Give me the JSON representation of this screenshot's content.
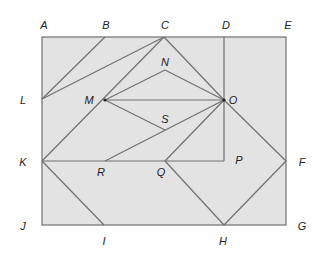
{
  "figure": {
    "type": "geometric-dissection",
    "colors": {
      "fill": "#e3e3e3",
      "stroke": "#707070",
      "label": "#222222"
    },
    "points": {
      "A": [
        42,
        37
      ],
      "B": [
        105,
        37
      ],
      "C": [
        164,
        37
      ],
      "D": [
        224,
        37
      ],
      "E": [
        286,
        37
      ],
      "L": [
        42,
        99
      ],
      "M": [
        105,
        100
      ],
      "N": [
        165,
        70
      ],
      "O": [
        224,
        100
      ],
      "S": [
        165,
        130
      ],
      "K": [
        42,
        161
      ],
      "R": [
        105,
        161
      ],
      "Q": [
        165,
        161
      ],
      "P": [
        224,
        161
      ],
      "F": [
        286,
        161
      ],
      "J": [
        42,
        225
      ],
      "I": [
        104,
        225
      ],
      "H": [
        224,
        225
      ],
      "G": [
        286,
        225
      ]
    },
    "labels": [
      {
        "text": "A",
        "x": 44,
        "y": 29
      },
      {
        "text": "B",
        "x": 106,
        "y": 29
      },
      {
        "text": "C",
        "x": 165,
        "y": 29
      },
      {
        "text": "D",
        "x": 226,
        "y": 29
      },
      {
        "text": "E",
        "x": 288,
        "y": 29
      },
      {
        "text": "L",
        "x": 23,
        "y": 104
      },
      {
        "text": "M",
        "x": 89,
        "y": 104
      },
      {
        "text": "N",
        "x": 165,
        "y": 66
      },
      {
        "text": "O",
        "x": 233,
        "y": 104
      },
      {
        "text": "S",
        "x": 165,
        "y": 123
      },
      {
        "text": "K",
        "x": 23,
        "y": 166
      },
      {
        "text": "R",
        "x": 101,
        "y": 176
      },
      {
        "text": "Q",
        "x": 161,
        "y": 176
      },
      {
        "text": "P",
        "x": 239,
        "y": 164
      },
      {
        "text": "F",
        "x": 302,
        "y": 166
      },
      {
        "text": "J",
        "x": 23,
        "y": 230
      },
      {
        "text": "I",
        "x": 104,
        "y": 245
      },
      {
        "text": "H",
        "x": 223,
        "y": 245
      },
      {
        "text": "G",
        "x": 302,
        "y": 230
      }
    ],
    "segments": [
      [
        "B",
        "L"
      ],
      [
        "C",
        "L"
      ],
      [
        "C",
        "K"
      ],
      [
        "C",
        "O"
      ],
      [
        "O",
        "F"
      ],
      [
        "M",
        "N"
      ],
      [
        "N",
        "O"
      ],
      [
        "M",
        "O"
      ],
      [
        "M",
        "S"
      ],
      [
        "O",
        "R"
      ],
      [
        "O",
        "Q"
      ],
      [
        "D",
        "P"
      ],
      [
        "K",
        "P"
      ],
      [
        "Q",
        "H"
      ],
      [
        "H",
        "F"
      ],
      [
        "K",
        "I"
      ]
    ]
  }
}
